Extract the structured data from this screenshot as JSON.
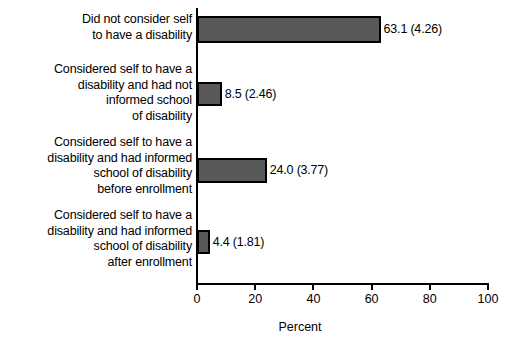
{
  "chart_data": {
    "type": "bar",
    "orientation": "horizontal",
    "title": "",
    "xlabel": "Percent",
    "ylabel": "",
    "xlim": [
      0,
      100
    ],
    "xticks": [
      "0",
      "20",
      "40",
      "60",
      "80",
      "100"
    ],
    "grid": false,
    "legend": null,
    "bar_color": "#595959",
    "bar_edge_color": "#000000",
    "categories": [
      "Did not consider self\nto have a disability",
      "Considered self to have a\ndisability and had not\ninformed school\nof disability",
      "Considered self to have a\ndisability and had informed\nschool of disability\nbefore enrollment",
      "Considered self to have a\ndisability and had informed\nschool of disability\nafter enrollment"
    ],
    "values": [
      63.1,
      8.5,
      24.0,
      4.4
    ],
    "standard_errors": [
      4.26,
      2.46,
      3.77,
      1.81
    ],
    "data_labels": [
      "63.1 (4.26)",
      "8.5 (2.46)",
      "24.0 (3.77)",
      "4.4 (1.81)"
    ]
  }
}
